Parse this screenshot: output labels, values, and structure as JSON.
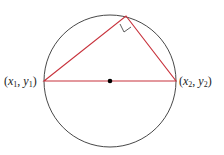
{
  "diagram": {
    "colors": {
      "circle": "#333333",
      "triangle": "#c8323c",
      "center": "#000000"
    },
    "labels": {
      "left_point": {
        "x": "x",
        "xsub": "1",
        "y": "y",
        "ysub": "1"
      },
      "right_point": {
        "x": "x",
        "xsub": "2",
        "y": "y",
        "ysub": "2"
      }
    }
  }
}
